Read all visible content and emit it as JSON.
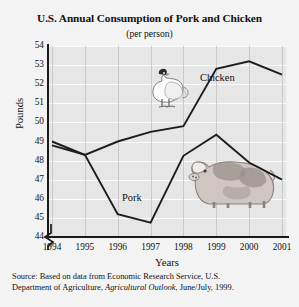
{
  "figure": {
    "title": "U.S. Annual Consumption of Pork and Chicken",
    "subtitle": "(per person)",
    "source_line1": "Source: Based on data from Economic Research Service, U.S.",
    "source_line2_pre": "Department of Agriculture, ",
    "source_line2_italic": "Agricultural Outlook",
    "source_line2_post": ", June/July, 1999.",
    "artwork": [
      {
        "name": "chicken-illustration",
        "label": "rooster"
      },
      {
        "name": "pig-illustration",
        "label": "pig"
      }
    ],
    "colors": {
      "page_background": "#f3f3f3",
      "plot_background": "#e6e6e6",
      "gridline_horizontal": "#fbfbfb",
      "gridline_vertical": "#c9c9c9",
      "axis": "#1a1a1a",
      "series_line": "#1d1d1d"
    }
  },
  "chart_data": {
    "type": "line",
    "title": "U.S. Annual Consumption of Pork and Chicken",
    "subtitle": "(per person)",
    "xlabel": "Years",
    "ylabel": "Pounds",
    "categories": [
      "1994",
      "1995",
      "1996",
      "1997",
      "1998",
      "1999",
      "2000",
      "2001"
    ],
    "x": [
      1994,
      1995,
      1996,
      1997,
      1998,
      1999,
      2000,
      2001
    ],
    "ylim": [
      44,
      54
    ],
    "yticks": [
      44,
      45,
      46,
      47,
      48,
      49,
      50,
      51,
      52,
      53,
      54
    ],
    "ytick_labels": [
      "44",
      "45",
      "46",
      "47",
      "48",
      "49",
      "50",
      "51",
      "52",
      "53",
      "54"
    ],
    "xtick_labels": [
      "1994",
      "1995",
      "1996",
      "1997",
      "1998",
      "1999",
      "2000",
      "2001"
    ],
    "y_axis_break": true,
    "grid": true,
    "legend": "inline-labels",
    "series": [
      {
        "name": "Chicken",
        "label": "Chicken",
        "values": [
          49.0,
          48.3,
          49.0,
          49.5,
          49.8,
          52.8,
          53.2,
          52.5
        ]
      },
      {
        "name": "Pork",
        "label": "Pork",
        "values": [
          48.8,
          48.3,
          45.2,
          44.75,
          48.25,
          49.35,
          47.9,
          47.0
        ]
      }
    ]
  }
}
